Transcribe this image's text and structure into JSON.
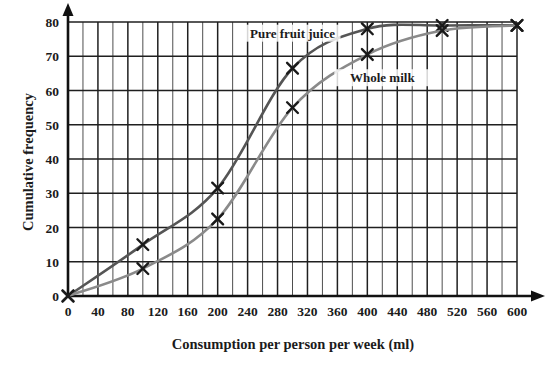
{
  "chart_data": {
    "type": "line",
    "title": "",
    "xlabel": "Consumption per person per week (ml)",
    "ylabel": "Cumulative frequency",
    "xlim": [
      0,
      600
    ],
    "ylim": [
      0,
      80
    ],
    "x_ticks": [
      0,
      40,
      80,
      120,
      160,
      200,
      240,
      280,
      320,
      360,
      400,
      440,
      480,
      520,
      560,
      600
    ],
    "y_ticks": [
      0,
      10,
      20,
      30,
      40,
      50,
      60,
      70,
      80
    ],
    "x_minor_step": 20,
    "y_minor_step": 10,
    "grid": true,
    "legend_position": "inline-annotation",
    "series": [
      {
        "name": "Pure fruit juice",
        "color": "#555555",
        "marker": "x",
        "label_x": 300,
        "label_y": 76,
        "x": [
          0,
          100,
          200,
          300,
          400,
          500,
          600
        ],
        "values": [
          0,
          15,
          31.5,
          66.5,
          78,
          79,
          79
        ]
      },
      {
        "name": "Whole milk",
        "color": "#8a8a8a",
        "marker": "x",
        "label_x": 420,
        "label_y": 63,
        "x": [
          0,
          100,
          200,
          300,
          400,
          500,
          600
        ],
        "values": [
          0,
          8,
          22.5,
          55,
          70.5,
          77.5,
          79
        ]
      }
    ],
    "annotations": [
      {
        "text": "Pure fruit juice",
        "x": 300,
        "y": 76
      },
      {
        "text": "Whole milk",
        "x": 420,
        "y": 63
      }
    ]
  },
  "axis": {
    "y_title": "Cumulative frequency",
    "x_title": "Consumption per person per week (ml)"
  }
}
